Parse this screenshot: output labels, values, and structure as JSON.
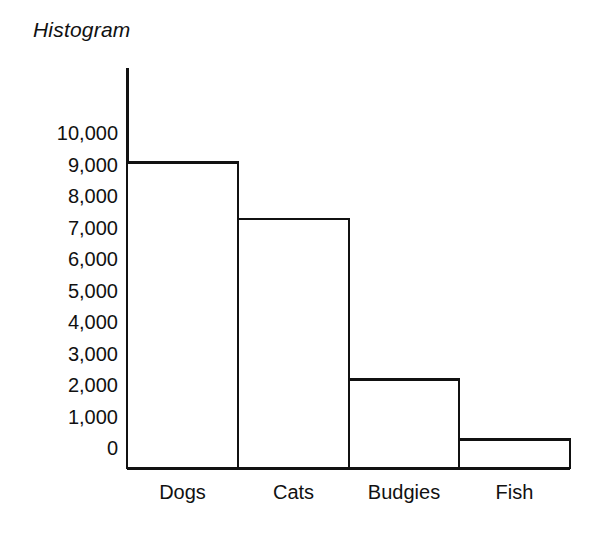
{
  "chart_data": {
    "type": "bar",
    "title": "Histogram",
    "xlabel": "",
    "ylabel": "",
    "categories": [
      "Dogs",
      "Cats",
      "Budgies",
      "Fish"
    ],
    "values": [
      9700,
      7900,
      2800,
      900
    ],
    "ylim": [
      0,
      10000
    ],
    "ytick_labels": [
      "10,000",
      "9,000",
      "8,000",
      "7,000",
      "6,000",
      "5,000",
      "4,000",
      "3,000",
      "2,000",
      "1,000",
      "0"
    ],
    "ytick_values": [
      10000,
      9000,
      8000,
      7000,
      6000,
      5000,
      4000,
      3000,
      2000,
      1000,
      0
    ],
    "grid": false,
    "legend": false,
    "bar_fill": "#ffffff",
    "bar_stroke": "#111111",
    "axis_color": "#111111",
    "background": "#ffffff"
  }
}
